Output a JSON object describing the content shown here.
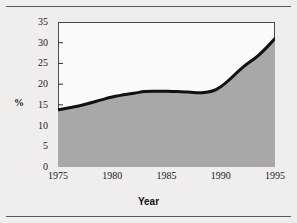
{
  "figure": {
    "background_color": "#efeeec",
    "rule_color": "#5a5a5a",
    "plot_background": "#fafafa"
  },
  "chart_data": {
    "type": "area",
    "title": "",
    "subtitle": "",
    "xlabel": "Year",
    "ylabel": "%",
    "xlim": [
      1975,
      1995
    ],
    "ylim": [
      0,
      35
    ],
    "grid": false,
    "legend": null,
    "series_color": "#111111",
    "fill_color": "#a8a8a8",
    "line_width": 3,
    "xticks": [
      1975,
      1980,
      1985,
      1990,
      1995
    ],
    "xticklabels": [
      "1975",
      "1980",
      "1985",
      "1990",
      "1995"
    ],
    "yticks": [
      0,
      5,
      10,
      15,
      20,
      25,
      30,
      35
    ],
    "yticklabels": [
      "0",
      "5",
      "10",
      "15",
      "20",
      "25",
      "30",
      "35"
    ],
    "x": [
      1975,
      1977,
      1979,
      1980,
      1982,
      1983,
      1984,
      1985,
      1986,
      1987,
      1988.5,
      1990,
      1992,
      1993.5,
      1995
    ],
    "values": [
      13.8,
      14.8,
      16.2,
      16.9,
      17.8,
      18.2,
      18.3,
      18.3,
      18.2,
      18.1,
      18.0,
      19.4,
      24.0,
      27.0,
      31.0
    ],
    "series": [
      {
        "name": "%",
        "values": [
          13.8,
          14.8,
          16.2,
          16.9,
          17.8,
          18.2,
          18.3,
          18.3,
          18.2,
          18.1,
          18.0,
          19.4,
          24.0,
          27.0,
          31.0
        ]
      }
    ]
  }
}
